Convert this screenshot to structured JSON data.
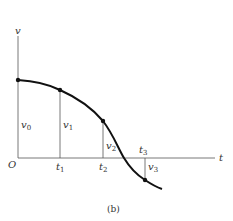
{
  "diagram": {
    "axes": {
      "vertical": "v",
      "horizontal": "t",
      "origin": "O"
    },
    "points": [
      {
        "t_label": "",
        "v_label": "v",
        "v_sub": "0"
      },
      {
        "t_label": "t",
        "t_sub": "1",
        "v_label": "v",
        "v_sub": "1"
      },
      {
        "t_label": "t",
        "t_sub": "2",
        "v_label": "v",
        "v_sub": "2"
      },
      {
        "t_label": "t",
        "t_sub": "3",
        "v_label": "v",
        "v_sub": "3"
      }
    ],
    "caption": "(b)"
  }
}
